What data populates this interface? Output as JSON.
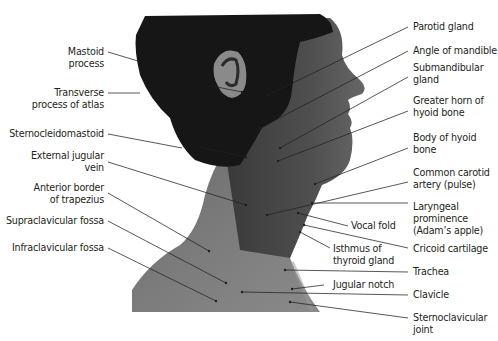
{
  "figure": {
    "colors": {
      "line": "#231f20",
      "text": "#231f20",
      "hair": "#161616",
      "skin_dark": "#5a5a5a",
      "skin_mid": "#7a7a7a",
      "skin_light": "#8e8e8e",
      "background": "#ffffff"
    }
  },
  "labels_left": [
    {
      "id": "mastoid",
      "text": "Mastoid\nprocess"
    },
    {
      "id": "transverse-atlas",
      "text": "Transverse\nprocess of atlas"
    },
    {
      "id": "sternocleidomastoid",
      "text": "Sternocleidomastoid"
    },
    {
      "id": "external-jugular",
      "text": "External jugular\nvein"
    },
    {
      "id": "anterior-trapezius",
      "text": "Anterior border\nof trapezius"
    },
    {
      "id": "supraclavicular",
      "text": "Supraclavicular fossa"
    },
    {
      "id": "infraclavicular",
      "text": "Infraclavicular fossa"
    }
  ],
  "labels_right": [
    {
      "id": "parotid",
      "text": "Parotid gland"
    },
    {
      "id": "angle-mandible",
      "text": "Angle of mandible"
    },
    {
      "id": "submandibular",
      "text": "Submandibular\ngland"
    },
    {
      "id": "greater-horn",
      "text": "Greater horn of\nhyoid bone"
    },
    {
      "id": "body-hyoid",
      "text": "Body of hyoid\nbone"
    },
    {
      "id": "common-carotid",
      "text": "Common carotid\nartery (pulse)"
    },
    {
      "id": "laryngeal",
      "text": "Laryngeal\nprominence\n(Adam’s apple)"
    },
    {
      "id": "cricoid",
      "text": "Cricoid cartilage"
    },
    {
      "id": "trachea",
      "text": "Trachea"
    },
    {
      "id": "clavicle",
      "text": "Clavicle"
    },
    {
      "id": "sternoclavicular",
      "text": "Sternoclavicular\njoint"
    }
  ],
  "labels_center": [
    {
      "id": "vocal-fold",
      "text": "Vocal fold"
    },
    {
      "id": "isthmus",
      "text": "Isthmus of\nthyroid gland"
    },
    {
      "id": "jugular-notch",
      "text": "Jugular notch"
    }
  ]
}
